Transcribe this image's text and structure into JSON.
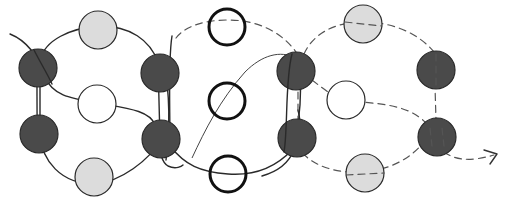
{
  "diagram": {
    "colors": {
      "dark": "#4a4a4a",
      "light": "#dcdcdc",
      "white": "#ffffff",
      "stroke": "#2a2a2a"
    },
    "nodes": [
      {
        "id": "dark-left-top",
        "kind": "dark",
        "cx": 38,
        "cy": 68,
        "r": 19
      },
      {
        "id": "dark-left-bottom",
        "kind": "dark",
        "cx": 39,
        "cy": 134,
        "r": 19
      },
      {
        "id": "light-left-top",
        "kind": "light",
        "cx": 98,
        "cy": 30,
        "r": 19
      },
      {
        "id": "white-left-middle",
        "kind": "white",
        "cx": 97,
        "cy": 104,
        "r": 19
      },
      {
        "id": "light-left-bottom",
        "kind": "light",
        "cx": 94,
        "cy": 177,
        "r": 19
      },
      {
        "id": "dark-center-left-top",
        "kind": "dark",
        "cx": 160,
        "cy": 73,
        "r": 19
      },
      {
        "id": "dark-center-left-bottom",
        "kind": "dark",
        "cx": 161,
        "cy": 139,
        "r": 19
      },
      {
        "id": "bold-center-top",
        "kind": "bold",
        "cx": 227,
        "cy": 27,
        "r": 18
      },
      {
        "id": "bold-center-middle",
        "kind": "bold",
        "cx": 227,
        "cy": 101,
        "r": 18
      },
      {
        "id": "bold-center-bottom",
        "kind": "bold",
        "cx": 228,
        "cy": 174,
        "r": 18
      },
      {
        "id": "dark-center-right-top",
        "kind": "dark",
        "cx": 296,
        "cy": 71,
        "r": 19
      },
      {
        "id": "dark-center-right-bottom",
        "kind": "dark",
        "cx": 297,
        "cy": 138,
        "r": 19
      },
      {
        "id": "light-right-top",
        "kind": "light",
        "cx": 363,
        "cy": 24,
        "r": 19
      },
      {
        "id": "white-right-middle",
        "kind": "white",
        "cx": 346,
        "cy": 100,
        "r": 19
      },
      {
        "id": "light-right-bottom",
        "kind": "light",
        "cx": 365,
        "cy": 173,
        "r": 19
      },
      {
        "id": "dark-right-top",
        "kind": "dark",
        "cx": 436,
        "cy": 70,
        "r": 19
      },
      {
        "id": "dark-right-bottom",
        "kind": "dark",
        "cx": 437,
        "cy": 137,
        "r": 19
      }
    ],
    "arrow": {
      "end_x": 497,
      "end_y": 155
    }
  }
}
